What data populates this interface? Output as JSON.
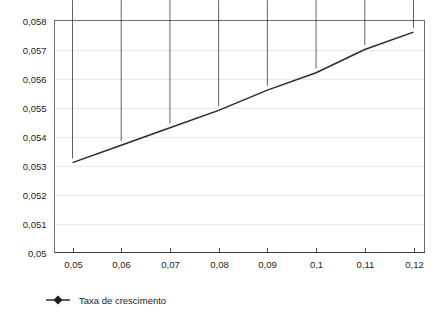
{
  "chart_data": {
    "type": "line",
    "title": "",
    "xlabel": "",
    "ylabel": "",
    "x": [
      0.05,
      0.06,
      0.07,
      0.08,
      0.09,
      0.1,
      0.11,
      0.12
    ],
    "x_tick_labels": [
      "0,05",
      "0,06",
      "0,07",
      "0,08",
      "0,09",
      "0,1",
      "0,11",
      "0,12"
    ],
    "y_tick_labels": [
      "0,058",
      "0,057",
      "0,056",
      "0,055",
      "0,054",
      "0,053",
      "0,052",
      "0,051",
      "0,05"
    ],
    "y_ticks": [
      0.058,
      0.057,
      0.056,
      0.055,
      0.054,
      0.053,
      0.052,
      0.051,
      0.05
    ],
    "ylim": [
      0.05,
      0.058
    ],
    "xlim": [
      0.05,
      0.12
    ],
    "grid": "horizontal",
    "legend_position": "bottom-left",
    "series": [
      {
        "name": "Taxa de crescimento",
        "marker": "diamond",
        "color": "#2b2b2b",
        "values": [
          0.0531,
          0.0537,
          0.0543,
          0.0549,
          0.0556,
          0.0562,
          0.057,
          0.0576
        ]
      }
    ]
  },
  "legend": {
    "items": [
      {
        "label": "Taxa de crescimento"
      }
    ]
  }
}
